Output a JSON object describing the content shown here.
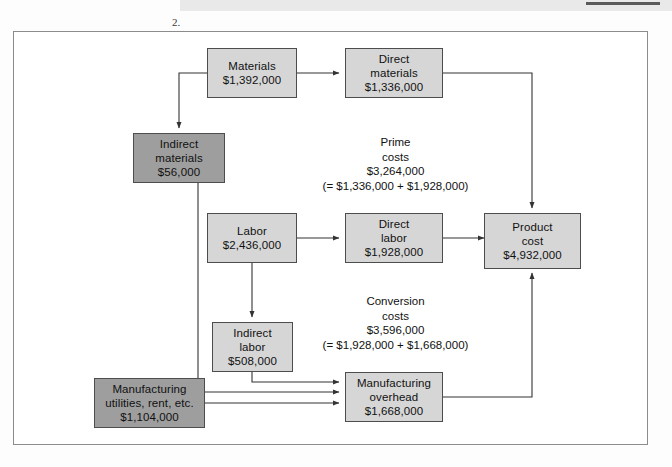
{
  "page": {
    "item_number": "2."
  },
  "diagram": {
    "colors": {
      "box_light": "#d6d6d6",
      "box_dark": "#9e9e9e",
      "box_border": "#4d4d4d",
      "frame_border": "#8c8c8c",
      "connector": "#333333",
      "band": "#e9e9e9",
      "rule": "#5a5a5a"
    },
    "boxes": [
      {
        "id": "materials",
        "shade": "light",
        "lines": [
          "Materials",
          "$1,392,000"
        ],
        "label": "Materials",
        "amount": "$1,392,000"
      },
      {
        "id": "direct-materials",
        "shade": "light",
        "lines": [
          "Direct",
          "materials",
          "$1,336,000"
        ],
        "label": "Direct materials",
        "amount": "$1,336,000"
      },
      {
        "id": "indirect-materials",
        "shade": "dark",
        "lines": [
          "Indirect",
          "materials",
          "$56,000"
        ],
        "label": "Indirect materials",
        "amount": "$56,000"
      },
      {
        "id": "labor",
        "shade": "light",
        "lines": [
          "Labor",
          "$2,436,000"
        ],
        "label": "Labor",
        "amount": "$2,436,000"
      },
      {
        "id": "direct-labor",
        "shade": "light",
        "lines": [
          "Direct",
          "labor",
          "$1,928,000"
        ],
        "label": "Direct labor",
        "amount": "$1,928,000"
      },
      {
        "id": "product-cost",
        "shade": "light",
        "lines": [
          "Product",
          "cost",
          "$4,932,000"
        ],
        "label": "Product cost",
        "amount": "$4,932,000"
      },
      {
        "id": "indirect-labor",
        "shade": "light",
        "lines": [
          "Indirect",
          "labor",
          "$508,000"
        ],
        "label": "Indirect labor",
        "amount": "$508,000"
      },
      {
        "id": "manufacturing-utilities",
        "shade": "dark",
        "lines": [
          "Manufacturing",
          "utilities, rent, etc.",
          "$1,104,000"
        ],
        "label": "Manufacturing utilities, rent, etc.",
        "amount": "$1,104,000"
      },
      {
        "id": "manufacturing-overhead",
        "shade": "light",
        "lines": [
          "Manufacturing",
          "overhead",
          "$1,668,000"
        ],
        "label": "Manufacturing overhead",
        "amount": "$1,668,000"
      }
    ],
    "annotations": [
      {
        "id": "prime-costs",
        "lines": [
          "Prime",
          "costs",
          "$3,264,000",
          "(= $1,336,000 + $1,928,000)"
        ],
        "label": "Prime costs",
        "amount": "$3,264,000",
        "formula": "(= $1,336,000 + $1,928,000)"
      },
      {
        "id": "conversion-costs",
        "lines": [
          "Conversion",
          "costs",
          "$3,596,000",
          "(= $1,928,000 + $1,668,000)"
        ],
        "label": "Conversion costs",
        "amount": "$3,596,000",
        "formula": "(= $1,928,000 + $1,668,000)"
      }
    ]
  }
}
